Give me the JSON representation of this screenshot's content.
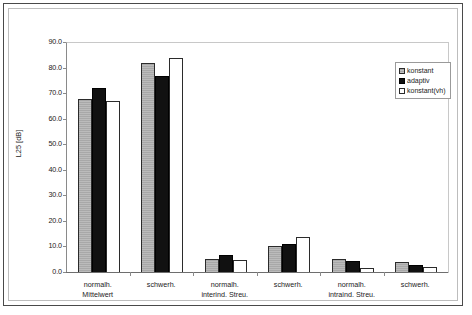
{
  "chart_data": {
    "type": "bar",
    "title": "",
    "subtitle": "",
    "xlabel": "",
    "ylabel": "L25 [dB]",
    "ylim": [
      0.0,
      90.0
    ],
    "ytick_step": 10.0,
    "ytick_labels": [
      "90.0",
      "80.0",
      "70.0",
      "60.0",
      "50.0",
      "40.0",
      "30.0",
      "20.0",
      "10.0",
      "0.0"
    ],
    "ytick_values": [
      90.0,
      80.0,
      70.0,
      60.0,
      50.0,
      40.0,
      30.0,
      20.0,
      10.0,
      0.0
    ],
    "grid": false,
    "legend_position": "top-right",
    "categories": [
      "normalh.\nMittelwert",
      "schwerh.",
      "normalh.\ninterind. Streu.",
      "schwerh.",
      "normalh.\nintraind. Streu.",
      "schwerh."
    ],
    "category_lines": [
      [
        "normalh.",
        "Mittelwert"
      ],
      [
        "schwerh.",
        ""
      ],
      [
        "normalh.",
        "interind. Streu."
      ],
      [
        "schwerh.",
        ""
      ],
      [
        "normalh.",
        "intraind. Streu."
      ],
      [
        "schwerh.",
        ""
      ]
    ],
    "series": [
      {
        "name": "konstant",
        "color": "#a8a8a8",
        "values": [
          68.0,
          82.0,
          5.5,
          10.5,
          5.5,
          4.2
        ]
      },
      {
        "name": "adaptiv",
        "color": "#111111",
        "values": [
          72.5,
          77.0,
          7.0,
          11.5,
          4.8,
          3.3
        ]
      },
      {
        "name": "konstant(vh)",
        "color": "#ffffff",
        "values": [
          67.5,
          84.0,
          5.0,
          14.0,
          2.0,
          2.5
        ]
      }
    ]
  },
  "legend": {
    "items": [
      {
        "label": "konstant",
        "swatch": "konstant"
      },
      {
        "label": "adaptiv",
        "swatch": "adaptiv"
      },
      {
        "label": "konstant(vh)",
        "swatch": "konstantvh"
      }
    ]
  },
  "axis": {
    "y_title": "L25 [dB]"
  }
}
